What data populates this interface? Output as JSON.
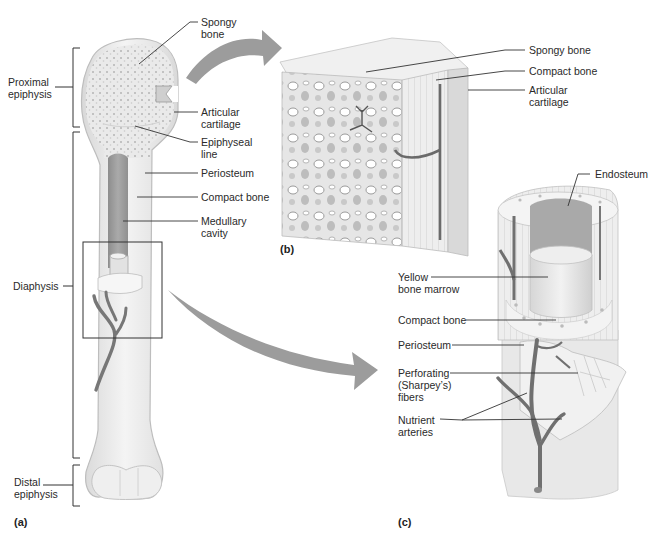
{
  "figure": {
    "panels": {
      "a": {
        "letter": "(a)",
        "subject": "whole long bone"
      },
      "b": {
        "letter": "(b)",
        "subject": "epiphysis cutaway"
      },
      "c": {
        "letter": "(c)",
        "subject": "diaphysis cutaway"
      }
    }
  },
  "labels_a": {
    "proximal_epiphysis": "Proximal\nepiphysis",
    "diaphysis": "Diaphysis",
    "distal_epiphysis": "Distal\nepiphysis",
    "spongy_bone": "Spongy\nbone",
    "articular_cartilage": "Articular\ncartilage",
    "epiphyseal_line": "Epiphyseal\nline",
    "periosteum": "Periosteum",
    "compact_bone": "Compact bone",
    "medullary_cavity": "Medullary\ncavity"
  },
  "labels_b": {
    "spongy_bone": "Spongy bone",
    "compact_bone": "Compact bone",
    "articular_cartilage": "Articular\ncartilage"
  },
  "labels_c": {
    "endosteum": "Endosteum",
    "yellow_bone_marrow": "Yellow\nbone marrow",
    "compact_bone": "Compact bone",
    "periosteum": "Periosteum",
    "perforating_fibers": "Perforating\n(Sharpey’s)\nfibers",
    "nutrient_arteries": "Nutrient\narteries"
  },
  "colors": {
    "bone": "#ececec",
    "bone_edge": "#bdbdbd",
    "marrow": "#9a9a9a",
    "artery": "#6f6f6f",
    "arrow": "#9c9c9c",
    "leader": "#333333"
  }
}
